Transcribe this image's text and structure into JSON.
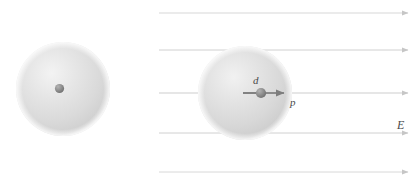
{
  "figure": {
    "background_color": "#ffffff",
    "width": 413,
    "height": 182,
    "labels": {
      "displacement": "d",
      "dipole_moment": "p",
      "electric_field": "E"
    },
    "colors": {
      "cloud_fill": "#d8d8d8",
      "cloud_highlight": "#efefef",
      "cloud_edge": "#c9c9c9",
      "nucleus": "#8c8c8c",
      "nucleus_dark": "#6e6e6e",
      "field_line": "#cfcfcf",
      "dipole_arrow": "#7a7a7a",
      "label_text": "#4a4a4a"
    },
    "panels": [
      {
        "name": "unpolarized-atom",
        "cloud_center_x": 63,
        "cloud_center_y": 89,
        "cloud_radius": 47,
        "nucleus_x": 59.5,
        "nucleus_y": 88.5,
        "nucleus_radius": 4.5,
        "has_field": false
      },
      {
        "name": "polarized-atom",
        "cloud_center_x": 245,
        "cloud_center_y": 93,
        "cloud_radius": 47,
        "nucleus_x": 261,
        "nucleus_y": 93,
        "nucleus_radius": 5,
        "has_field": true,
        "displacement_start_x": 243,
        "dipole_arrow_end_x": 286
      }
    ],
    "field_lines": {
      "count": 5,
      "x_start": 159,
      "x_end": 410,
      "y_positions": [
        13,
        50,
        93,
        133,
        172
      ],
      "direction": "right"
    },
    "label_positions": {
      "d": {
        "x": 253,
        "y": 84
      },
      "p": {
        "x": 290,
        "y": 105
      },
      "E": {
        "x": 397,
        "y": 128
      }
    }
  }
}
